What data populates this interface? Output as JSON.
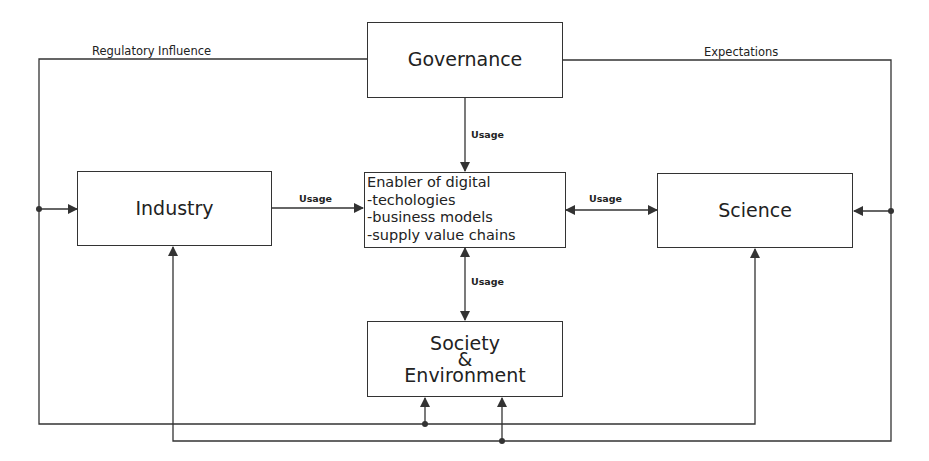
{
  "diagram": {
    "nodes": {
      "governance": {
        "label": "Governance"
      },
      "enabler": {
        "lines": [
          "Enabler of digital",
          "-techologies",
          "-business models",
          "-supply value chains"
        ]
      },
      "industry": {
        "label": "Industry"
      },
      "science": {
        "label": "Science"
      },
      "society": {
        "lines": [
          "Society",
          "&",
          "Environment"
        ]
      }
    },
    "edge_labels": {
      "regulatory_influence": "Regulatory Influence",
      "expectations": "Expectations",
      "usage_governance": "Usage",
      "usage_industry": "Usage",
      "usage_science": "Usage",
      "usage_society": "Usage"
    },
    "colors": {
      "line": "#333333",
      "background": "#ffffff",
      "text": "#222222"
    }
  }
}
